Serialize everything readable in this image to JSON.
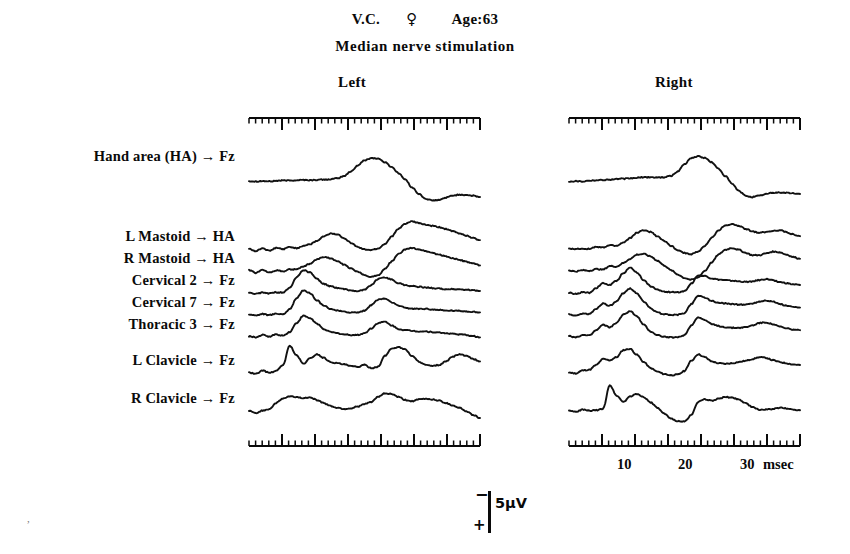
{
  "header": {
    "subject_initials": "V.C.",
    "sex_symbol": "♀",
    "sex": "female",
    "age_label": "Age:",
    "age_value": "63",
    "age_text": "Age:63",
    "study_title": "Median  nerve  stimulation"
  },
  "panels": {
    "left_label": "Left",
    "right_label": "Right"
  },
  "channels": [
    {
      "id": "hand-area-fz",
      "label": "Hand area (HA) →  Fz",
      "text_left": "Hand area (HA)",
      "arrow": "→",
      "reference": "Fz"
    },
    {
      "id": "l-mastoid-ha",
      "label": "L Mastoid → HA",
      "text_left": "L Mastoid",
      "arrow": "→",
      "reference": "HA"
    },
    {
      "id": "r-mastoid-ha",
      "label": "R Mastoid → HA",
      "text_left": "R Mastoid",
      "arrow": "→",
      "reference": "HA"
    },
    {
      "id": "cervical-2-fz",
      "label": "Cervical 2 →  Fz",
      "text_left": "Cervical 2",
      "arrow": "→",
      "reference": "Fz"
    },
    {
      "id": "cervical-7-fz",
      "label": "Cervical 7 →  Fz",
      "text_left": "Cervical 7",
      "arrow": "→",
      "reference": "Fz"
    },
    {
      "id": "thoracic-3-fz",
      "label": "Thoracic 3 →  Fz",
      "text_left": "Thoracic 3",
      "arrow": "→",
      "reference": "Fz"
    },
    {
      "id": "l-clavicle-fz",
      "label": "L Clavicle →  Fz",
      "text_left": "L Clavicle",
      "arrow": "→",
      "reference": "Fz"
    },
    {
      "id": "r-clavicle-fz",
      "label": "R Clavicle →  Fz",
      "text_left": "R Clavicle",
      "arrow": "→",
      "reference": "Fz"
    }
  ],
  "time_axis": {
    "ticks": [
      "10",
      "20",
      "30"
    ],
    "unit": "msec",
    "unit_suffix_label": "30msec",
    "minor_tick_interval_ms": 1,
    "major_tick_interval_ms": 5,
    "range_ms": [
      0,
      35
    ]
  },
  "calibration": {
    "amplitude": "5μV",
    "polarity_top": "−",
    "polarity_bottom": "+",
    "negative_up": true
  },
  "chart_data": {
    "type": "line",
    "xlabel": "msec",
    "ylabel": "5μV",
    "xlim": [
      0,
      35
    ],
    "grid": false,
    "legend": "none",
    "subplots": [
      {
        "name": "Left",
        "series": [
          {
            "name": "Hand area (HA) → Fz",
            "values": [
              0.03,
              0.02,
              0.03,
              0.02,
              0.04,
              0.05,
              0.05,
              0.06,
              0.07,
              0.06,
              0.07,
              0.08,
              0.09,
              0.12,
              0.2,
              0.35,
              0.55,
              0.72,
              0.8,
              0.78,
              0.66,
              0.5,
              0.3,
              0.08,
              -0.18,
              -0.4,
              -0.56,
              -0.62,
              -0.6,
              -0.52,
              -0.45,
              -0.42,
              -0.43,
              -0.46,
              -0.5
            ]
          },
          {
            "name": "L Mastoid → HA",
            "values": [
              0.05,
              -0.04,
              0.06,
              -0.03,
              0.07,
              0.03,
              0.1,
              0.06,
              0.14,
              0.2,
              0.3,
              0.45,
              0.55,
              0.52,
              0.4,
              0.24,
              0.1,
              0.02,
              0.0,
              0.05,
              0.2,
              0.45,
              0.7,
              0.88,
              0.95,
              0.9,
              0.84,
              0.8,
              0.76,
              0.7,
              0.62,
              0.55,
              0.48,
              0.4,
              0.33
            ]
          },
          {
            "name": "R Mastoid → HA",
            "values": [
              0.06,
              -0.03,
              0.07,
              -0.02,
              0.06,
              0.02,
              0.09,
              0.08,
              0.18,
              0.28,
              0.42,
              0.5,
              0.46,
              0.36,
              0.24,
              0.12,
              0.0,
              -0.1,
              -0.16,
              -0.1,
              0.1,
              0.35,
              0.6,
              0.75,
              0.8,
              0.76,
              0.7,
              0.64,
              0.58,
              0.52,
              0.46,
              0.4,
              0.34,
              0.28,
              0.22
            ]
          },
          {
            "name": "Cervical 2 → Fz",
            "values": [
              0.04,
              0.0,
              0.05,
              0.02,
              0.06,
              0.05,
              0.2,
              0.55,
              0.8,
              0.72,
              0.5,
              0.34,
              0.26,
              0.2,
              0.16,
              0.12,
              0.1,
              0.14,
              0.3,
              0.5,
              0.56,
              0.48,
              0.36,
              0.3,
              0.26,
              0.24,
              0.22,
              0.2,
              0.18,
              0.16,
              0.16,
              0.15,
              0.14,
              0.12,
              0.1
            ]
          },
          {
            "name": "Cervical 7 → Fz",
            "values": [
              0.05,
              0.02,
              0.07,
              0.03,
              0.08,
              0.06,
              0.22,
              0.6,
              0.86,
              0.76,
              0.52,
              0.34,
              0.24,
              0.18,
              0.14,
              0.12,
              0.12,
              0.18,
              0.36,
              0.55,
              0.58,
              0.46,
              0.34,
              0.28,
              0.24,
              0.24,
              0.24,
              0.22,
              0.2,
              0.18,
              0.18,
              0.17,
              0.16,
              0.14,
              0.12
            ]
          },
          {
            "name": "Thoracic 3 → Fz",
            "values": [
              0.06,
              0.02,
              0.1,
              0.05,
              0.12,
              0.08,
              0.2,
              0.5,
              0.74,
              0.66,
              0.48,
              0.3,
              0.2,
              0.16,
              0.12,
              0.1,
              0.1,
              0.16,
              0.32,
              0.5,
              0.54,
              0.42,
              0.3,
              0.26,
              0.24,
              0.22,
              0.22,
              0.2,
              0.18,
              0.16,
              0.14,
              0.12,
              0.1,
              0.06,
              0.02
            ]
          },
          {
            "name": "L Clavicle → Fz",
            "values": [
              0.05,
              0.0,
              0.12,
              0.04,
              0.1,
              0.3,
              0.95,
              0.62,
              0.34,
              0.52,
              0.66,
              0.54,
              0.4,
              0.36,
              0.32,
              0.26,
              0.24,
              0.3,
              0.2,
              0.24,
              0.6,
              0.85,
              0.9,
              0.82,
              0.6,
              0.42,
              0.3,
              0.26,
              0.3,
              0.42,
              0.58,
              0.66,
              0.6,
              0.5,
              0.42
            ]
          },
          {
            "name": "R Clavicle → Fz",
            "values": [
              0.03,
              -0.04,
              0.05,
              0.1,
              0.3,
              0.45,
              0.52,
              0.5,
              0.46,
              0.5,
              0.4,
              0.3,
              0.2,
              0.14,
              0.1,
              0.12,
              0.18,
              0.26,
              0.34,
              0.5,
              0.62,
              0.6,
              0.5,
              0.4,
              0.36,
              0.42,
              0.44,
              0.42,
              0.38,
              0.3,
              0.22,
              0.14,
              0.02,
              -0.1,
              -0.2
            ]
          }
        ]
      },
      {
        "name": "Right",
        "series": [
          {
            "name": "Hand area (HA) → Fz",
            "values": [
              0.02,
              0.03,
              0.02,
              0.05,
              0.06,
              0.07,
              0.08,
              0.1,
              0.11,
              0.12,
              0.14,
              0.16,
              0.16,
              0.15,
              0.16,
              0.2,
              0.35,
              0.6,
              0.8,
              0.86,
              0.8,
              0.66,
              0.44,
              0.2,
              -0.06,
              -0.3,
              -0.46,
              -0.5,
              -0.46,
              -0.4,
              -0.36,
              -0.35,
              -0.36,
              -0.38,
              -0.4
            ]
          },
          {
            "name": "L Mastoid → HA",
            "values": [
              0.04,
              0.03,
              0.05,
              0.04,
              0.1,
              0.08,
              0.16,
              0.14,
              0.25,
              0.4,
              0.58,
              0.66,
              0.6,
              0.46,
              0.3,
              0.14,
              0.0,
              -0.1,
              -0.14,
              -0.06,
              0.14,
              0.4,
              0.66,
              0.82,
              0.86,
              0.8,
              0.7,
              0.62,
              0.58,
              0.6,
              0.64,
              0.66,
              0.6,
              0.52,
              0.46
            ]
          },
          {
            "name": "R Mastoid → HA",
            "values": [
              0.05,
              0.02,
              0.06,
              0.04,
              0.1,
              0.08,
              0.2,
              0.18,
              0.3,
              0.44,
              0.58,
              0.6,
              0.52,
              0.38,
              0.22,
              0.06,
              -0.08,
              -0.2,
              -0.26,
              -0.18,
              0.04,
              0.32,
              0.58,
              0.74,
              0.8,
              0.74,
              0.64,
              0.56,
              0.56,
              0.62,
              0.68,
              0.66,
              0.58,
              0.5,
              0.44
            ]
          },
          {
            "name": "Cervical 2 → Fz",
            "values": [
              0.04,
              0.0,
              0.06,
              0.04,
              0.2,
              0.36,
              0.3,
              0.44,
              0.7,
              0.88,
              0.72,
              0.46,
              0.26,
              0.14,
              0.08,
              0.06,
              0.06,
              0.1,
              0.35,
              0.62,
              0.6,
              0.52,
              0.48,
              0.46,
              0.44,
              0.42,
              0.4,
              0.42,
              0.46,
              0.5,
              0.46,
              0.4,
              0.36,
              0.32,
              0.3
            ]
          },
          {
            "name": "Cervical 7 → Fz",
            "values": [
              0.05,
              0.01,
              0.08,
              0.06,
              0.24,
              0.42,
              0.34,
              0.48,
              0.76,
              0.92,
              0.76,
              0.48,
              0.26,
              0.12,
              0.06,
              0.04,
              0.04,
              0.1,
              0.4,
              0.68,
              0.62,
              0.5,
              0.44,
              0.42,
              0.4,
              0.38,
              0.38,
              0.42,
              0.48,
              0.52,
              0.48,
              0.4,
              0.34,
              0.3,
              0.28
            ]
          },
          {
            "name": "Thoracic 3 → Fz",
            "values": [
              0.06,
              0.02,
              0.1,
              0.08,
              0.26,
              0.44,
              0.36,
              0.5,
              0.78,
              0.9,
              0.72,
              0.44,
              0.22,
              0.1,
              0.04,
              0.02,
              0.02,
              0.1,
              0.42,
              0.7,
              0.6,
              0.46,
              0.4,
              0.36,
              0.34,
              0.34,
              0.36,
              0.42,
              0.5,
              0.52,
              0.46,
              0.38,
              0.32,
              0.28,
              0.26
            ]
          },
          {
            "name": "L Clavicle → Fz",
            "values": [
              0.05,
              0.02,
              0.12,
              0.14,
              0.3,
              0.5,
              0.46,
              0.56,
              0.8,
              0.84,
              0.64,
              0.4,
              0.2,
              0.08,
              0.0,
              -0.04,
              -0.02,
              0.1,
              0.44,
              0.66,
              0.56,
              0.42,
              0.36,
              0.34,
              0.36,
              0.4,
              0.44,
              0.5,
              0.56,
              0.54,
              0.46,
              0.4,
              0.36,
              0.32,
              0.3
            ]
          },
          {
            "name": "R Clavicle → Fz",
            "values": [
              0.06,
              0.0,
              0.08,
              0.04,
              0.06,
              0.1,
              0.9,
              0.55,
              0.34,
              0.52,
              0.6,
              0.5,
              0.32,
              0.14,
              -0.06,
              -0.22,
              -0.3,
              -0.32,
              -0.1,
              0.34,
              0.42,
              0.38,
              0.44,
              0.5,
              0.48,
              0.42,
              0.3,
              0.16,
              0.08,
              0.08,
              0.1,
              0.14,
              0.12,
              0.08,
              0.06
            ]
          }
        ]
      }
    ]
  }
}
